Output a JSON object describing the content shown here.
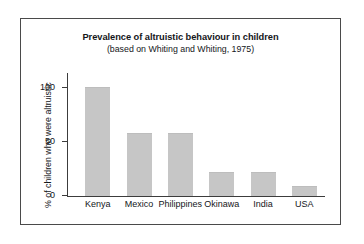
{
  "chart_data": {
    "type": "bar",
    "title": "Prevalence of altruistic behaviour in children",
    "subtitle": "(based on Whiting and Whiting, 1975)",
    "xlabel": "",
    "ylabel": "% of children who were altruistic",
    "categories": [
      "Kenya",
      "Mexico",
      "Philippines",
      "Okinawa",
      "India",
      "USA"
    ],
    "values": [
      100,
      57,
      57,
      21,
      21,
      8
    ],
    "ylim": [
      0,
      115
    ],
    "yticks": [
      0,
      50,
      100
    ],
    "ytick_labels": [
      "0",
      "50",
      "100"
    ],
    "grid": false,
    "legend": null,
    "bar_color": "#c6c6c6",
    "axis_color": "#3c3c3c",
    "frame_color": "#4a4a4a",
    "background_color": "#ffffff"
  }
}
